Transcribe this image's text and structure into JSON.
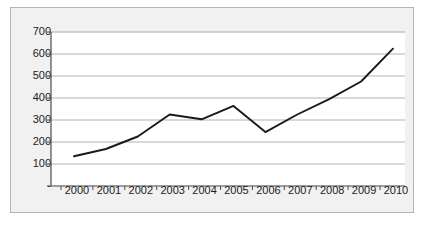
{
  "chart_data": {
    "type": "line",
    "title": "",
    "subtitle": "",
    "xlabel": "",
    "ylabel": "",
    "categories": [
      "2000",
      "2001",
      "2002",
      "2003",
      "2004",
      "2005",
      "2006",
      "2007",
      "2008",
      "2009",
      "2010"
    ],
    "values": [
      135,
      168,
      225,
      325,
      303,
      364,
      245,
      325,
      395,
      475,
      624
    ],
    "series": [
      {
        "name": "",
        "values": [
          135,
          168,
          225,
          325,
          303,
          364,
          245,
          325,
          395,
          475,
          624
        ],
        "color": "#1a1a1a"
      }
    ],
    "ylim": [
      0,
      700
    ],
    "yticks": [
      0,
      100,
      200,
      300,
      400,
      500,
      600,
      700
    ],
    "ytick_labels": [
      "-",
      "100",
      "200",
      "300",
      "400",
      "500",
      "600",
      "700"
    ],
    "xticks": [
      "2000",
      "2001",
      "2002",
      "2003",
      "2004",
      "2005",
      "2006",
      "2007",
      "2008",
      "2009",
      "2010"
    ],
    "grid": "horizontal",
    "legend": "none",
    "annotations": []
  },
  "style": {
    "panel_background": "#f1f1f1",
    "panel_border": "#b4b4b4",
    "plot_background": "#ffffff",
    "gridline_color": "#a9a9a9",
    "axis_color": "#4d4d4d",
    "line_color": "#1a1a1a",
    "label_color": "#1b1b1b"
  }
}
